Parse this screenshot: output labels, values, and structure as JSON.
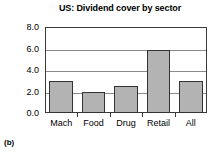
{
  "chart_data": {
    "type": "bar",
    "title": "US: Dividend cover by sector",
    "xlabel": "",
    "ylabel": "",
    "categories": [
      "Mach",
      "Food",
      "Drug",
      "Retail",
      "All"
    ],
    "values": [
      3.0,
      2.0,
      2.5,
      5.85,
      3.0
    ],
    "ylim": [
      0.0,
      8.0
    ],
    "yticks": [
      0.0,
      2.0,
      4.0,
      6.0,
      8.0
    ],
    "ytick_labels": [
      "0.0",
      "2.0",
      "4.0",
      "6.0",
      "8.0"
    ],
    "grid": true,
    "legend": null,
    "bar_color": "#b3b3b3",
    "bar_edge_color": "#333333",
    "grid_color": "#8a8a8a",
    "frame_color": "#3a3a3a"
  },
  "caption": {
    "label": "(b)"
  }
}
